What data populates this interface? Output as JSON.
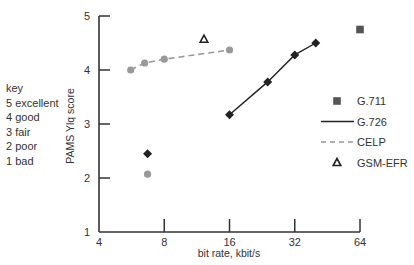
{
  "key": {
    "title": "key",
    "items": [
      "5 excellent",
      "4 good",
      "3 fair",
      "2 poor",
      "1 bad"
    ]
  },
  "chart_data": {
    "type": "scatter",
    "title": "",
    "xlabel": "bit rate, kbit/s",
    "ylabel": "PAMS Ylq score",
    "x_scale": "log2",
    "xlim": [
      4,
      64
    ],
    "ylim": [
      1,
      5
    ],
    "x_ticks": [
      4,
      8,
      16,
      32,
      64
    ],
    "y_ticks": [
      1,
      2,
      3,
      4,
      5
    ],
    "grid": false,
    "legend_position": "right",
    "series": [
      {
        "name": "G.711",
        "marker": "square",
        "line": "none",
        "color": "#555555",
        "points": [
          [
            64,
            4.75
          ]
        ]
      },
      {
        "name": "G.726",
        "marker": "diamond",
        "line": "solid",
        "color": "#222222",
        "points": [
          [
            16,
            3.17
          ],
          [
            24,
            3.78
          ],
          [
            32,
            4.28
          ],
          [
            40,
            4.5
          ]
        ]
      },
      {
        "name": "CELP",
        "marker": "circle",
        "line": "dashed",
        "color": "#999999",
        "points": [
          [
            5.6,
            4.0
          ],
          [
            6.5,
            4.13
          ],
          [
            8,
            4.2
          ],
          [
            16,
            4.37
          ]
        ]
      },
      {
        "name": "GSM-EFR",
        "marker": "triangle",
        "line": "none",
        "color": "#222222",
        "points": [
          [
            12.2,
            4.57
          ]
        ]
      }
    ],
    "extra_points": [
      {
        "series": "G.726",
        "marker": "diamond",
        "color": "#222222",
        "point": [
          6.7,
          2.45
        ]
      },
      {
        "series": "CELP",
        "marker": "circle",
        "color": "#999999",
        "point": [
          6.7,
          2.07
        ]
      }
    ]
  }
}
